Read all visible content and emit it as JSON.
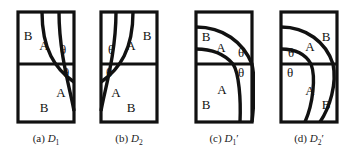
{
  "figure": {
    "background": "#ffffff",
    "stroke_color": "#111111",
    "panel_count": 4
  },
  "panels": [
    {
      "id": "D1",
      "caption_tag": "(a)",
      "caption_symbol": "D",
      "caption_subscript": "1",
      "caption_prime": "",
      "caption_full": "(a) D1",
      "regions": [
        {
          "label": "B",
          "x": 18,
          "y": 36
        },
        {
          "label": "A",
          "x": 41,
          "y": 46
        },
        {
          "label": "θ",
          "x": 65,
          "y": 50
        },
        {
          "label": "θ",
          "x": 69,
          "y": 73
        },
        {
          "label": "A",
          "x": 62,
          "y": 92
        },
        {
          "label": "B",
          "x": 44,
          "y": 107
        }
      ]
    },
    {
      "id": "D2",
      "caption_tag": "(b)",
      "caption_symbol": "D",
      "caption_subscript": "2",
      "caption_prime": "",
      "caption_full": "(b) D2",
      "regions": [
        {
          "label": "θ",
          "x": 17,
          "y": 50
        },
        {
          "label": "A",
          "x": 43,
          "y": 46
        },
        {
          "label": "B",
          "x": 66,
          "y": 36
        },
        {
          "label": "θ",
          "x": 14,
          "y": 73
        },
        {
          "label": "A",
          "x": 24,
          "y": 92
        },
        {
          "label": "B",
          "x": 43,
          "y": 107
        }
      ]
    },
    {
      "id": "D1prime",
      "caption_tag": "(c)",
      "caption_symbol": "D",
      "caption_subscript": "1",
      "caption_prime": "′",
      "caption_full": "(c) D1′",
      "regions": [
        {
          "label": "B",
          "x": 18,
          "y": 37
        },
        {
          "label": "A",
          "x": 40,
          "y": 48
        },
        {
          "label": "θ",
          "x": 64,
          "y": 53
        },
        {
          "label": "θ",
          "x": 64,
          "y": 73
        },
        {
          "label": "A",
          "x": 41,
          "y": 90
        },
        {
          "label": "B",
          "x": 17,
          "y": 104
        }
      ]
    },
    {
      "id": "D2prime",
      "caption_tag": "(d)",
      "caption_symbol": "D",
      "caption_subscript": "2",
      "caption_prime": "′",
      "caption_full": "(d) D2′",
      "regions": [
        {
          "label": "θ",
          "x": 17,
          "y": 53
        },
        {
          "label": "A",
          "x": 42,
          "y": 47
        },
        {
          "label": "B",
          "x": 64,
          "y": 37
        },
        {
          "label": "θ",
          "x": 16,
          "y": 73
        },
        {
          "label": "A",
          "x": 42,
          "y": 91
        },
        {
          "label": "B",
          "x": 64,
          "y": 104
        }
      ]
    }
  ]
}
